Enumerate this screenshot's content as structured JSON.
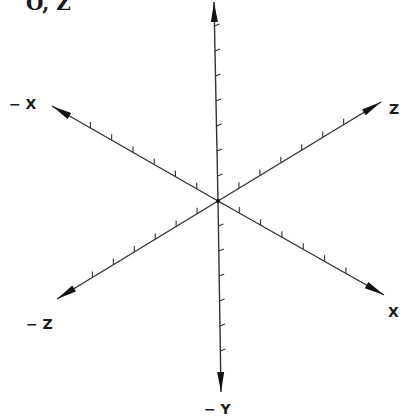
{
  "figure": {
    "title_fragment": "O, Z",
    "line_color": "#333333",
    "center": [
      218,
      201
    ],
    "axes": [
      {
        "id": "pos-y",
        "label": "",
        "tip": [
          214,
          2
        ],
        "ticks": 7,
        "arrow": true
      },
      {
        "id": "neg-y",
        "label": "− Y",
        "tip": [
          221,
          392
        ],
        "ticks": 6,
        "arrow": true
      },
      {
        "id": "neg-x",
        "label": "− X",
        "tip": [
          52,
          106
        ],
        "ticks": 6,
        "arrow": true
      },
      {
        "id": "pos-x",
        "label": "X",
        "tip": [
          384,
          295
        ],
        "ticks": 6,
        "arrow": true
      },
      {
        "id": "pos-z",
        "label": "Z",
        "tip": [
          381,
          102
        ],
        "ticks": 6,
        "arrow": true
      },
      {
        "id": "neg-z",
        "label": "− Z",
        "tip": [
          57,
          299
        ],
        "ticks": 6,
        "arrow": true
      }
    ]
  },
  "labels": {
    "title": "O, Z",
    "neg_x": "− X",
    "pos_x": "X",
    "pos_z": "Z",
    "neg_z": "− Z",
    "neg_y": "− Y"
  }
}
